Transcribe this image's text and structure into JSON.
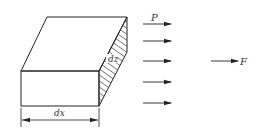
{
  "diagram": {
    "type": "mechanics-element",
    "labels": {
      "depth_label": "dz",
      "width_label": "dx",
      "pressure_label": "P",
      "resultant_label": "F"
    },
    "colors": {
      "stroke": "#222222",
      "hatch": "#333333",
      "background": "#ffffff"
    },
    "pressure_arrows": {
      "count": 5,
      "y_positions": [
        24,
        41,
        61,
        82,
        103
      ]
    }
  }
}
